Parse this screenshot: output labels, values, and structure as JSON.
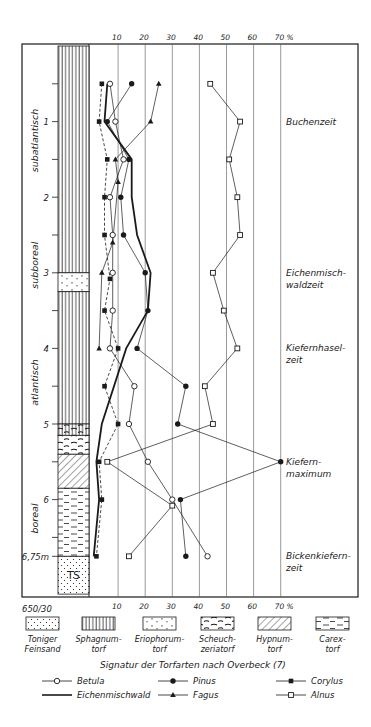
{
  "chart_data": {
    "type": "line",
    "xlabel": "%",
    "ylabel": "Depth (m)",
    "x_ticks": [
      "10",
      "20",
      "30",
      "40",
      "50",
      "60",
      "70 %"
    ],
    "x_tick_values": [
      10,
      20,
      30,
      40,
      50,
      60,
      70
    ],
    "xlim": [
      0,
      70
    ],
    "depth_ticks": [
      0.5,
      1,
      1.5,
      2,
      2.5,
      3,
      3.5,
      4,
      4.5,
      5,
      5.5,
      6,
      6.5,
      6.75
    ],
    "depth_labels": [
      {
        "depth": 1,
        "label": "1"
      },
      {
        "depth": 2,
        "label": "2"
      },
      {
        "depth": 3,
        "label": "3"
      },
      {
        "depth": 4,
        "label": "4"
      },
      {
        "depth": 5,
        "label": "5"
      },
      {
        "depth": 6,
        "label": "6"
      },
      {
        "depth": 6.75,
        "label": "6,75m"
      }
    ],
    "corner_label": "650/30",
    "periods": [
      {
        "label": "subatlantisch",
        "from": 0.3,
        "to": 2.2
      },
      {
        "label": "subboreal",
        "from": 2.2,
        "to": 3.6
      },
      {
        "label": "atlantisch",
        "from": 3.8,
        "to": 5.1
      },
      {
        "label": "boreal",
        "from": 5.7,
        "to": 6.8
      }
    ],
    "zones": [
      {
        "label": "Buchenzeit",
        "depth": 1.0
      },
      {
        "label": "Eichenmisch-",
        "label2": "waldzeit",
        "depth": 3.0
      },
      {
        "label": "Kiefernhasel-",
        "label2": "zeit",
        "depth": 4.0
      },
      {
        "label": "Kiefern-",
        "label2": "maximum",
        "depth": 5.5
      },
      {
        "label": "Bickenkiefern-",
        "label2": "zeit",
        "depth": 6.75
      }
    ],
    "series": [
      {
        "name": "Betula",
        "marker": "open-circle",
        "line": "thin",
        "points": [
          [
            0.5,
            7
          ],
          [
            1,
            9
          ],
          [
            1.5,
            12
          ],
          [
            2,
            7
          ],
          [
            2.5,
            8
          ],
          [
            3,
            8
          ],
          [
            3.5,
            8
          ],
          [
            4,
            7
          ],
          [
            4.5,
            16
          ],
          [
            5,
            14
          ],
          [
            5.5,
            21
          ],
          [
            6,
            30
          ],
          [
            6.75,
            43
          ]
        ]
      },
      {
        "name": "Pinus",
        "marker": "filled-circle",
        "line": "thin",
        "points": [
          [
            0.5,
            15
          ],
          [
            1,
            6
          ],
          [
            1.5,
            14
          ],
          [
            2,
            11
          ],
          [
            2.5,
            12
          ],
          [
            3,
            20
          ],
          [
            3.5,
            21
          ],
          [
            4,
            17
          ],
          [
            4.5,
            35
          ],
          [
            5,
            32
          ],
          [
            5.5,
            70
          ],
          [
            6,
            33
          ],
          [
            6.75,
            35
          ]
        ]
      },
      {
        "name": "Corylus",
        "marker": "filled-square",
        "line": "dashed",
        "points": [
          [
            0.5,
            4
          ],
          [
            1,
            3
          ],
          [
            1.5,
            6
          ],
          [
            2,
            5
          ],
          [
            2.5,
            5
          ],
          [
            3.08,
            7
          ],
          [
            3.5,
            5
          ],
          [
            4,
            10
          ],
          [
            4.5,
            5
          ],
          [
            5,
            10
          ],
          [
            5.5,
            3
          ],
          [
            6,
            4
          ],
          [
            6.75,
            2
          ]
        ]
      },
      {
        "name": "Eichenmischwald",
        "marker": "none",
        "line": "thick",
        "points": [
          [
            0.5,
            6
          ],
          [
            1,
            5
          ],
          [
            1.5,
            15
          ],
          [
            2,
            15
          ],
          [
            2.5,
            17
          ],
          [
            3,
            22
          ],
          [
            3.5,
            21
          ],
          [
            4,
            13
          ],
          [
            5,
            4
          ],
          [
            5.5,
            2
          ],
          [
            6,
            3
          ],
          [
            6.75,
            1
          ]
        ]
      },
      {
        "name": "Fagus",
        "marker": "filled-triangle",
        "line": "thin",
        "points": [
          [
            0.5,
            25
          ],
          [
            1,
            22
          ],
          [
            1.5,
            9
          ],
          [
            1.8,
            10
          ],
          [
            2.6,
            8
          ],
          [
            3,
            4
          ],
          [
            4,
            3
          ]
        ]
      },
      {
        "name": "Alnus",
        "marker": "open-square",
        "line": "thin",
        "points": [
          [
            0.5,
            44
          ],
          [
            1,
            55
          ],
          [
            1.5,
            51
          ],
          [
            2,
            54
          ],
          [
            2.5,
            55
          ],
          [
            3,
            45
          ],
          [
            3.5,
            49
          ],
          [
            4,
            54
          ],
          [
            4.5,
            42
          ],
          [
            5,
            45
          ],
          [
            5.5,
            6
          ],
          [
            6.08,
            30
          ],
          [
            6.75,
            14
          ]
        ]
      }
    ],
    "sediment_column": [
      {
        "type": "sphagnum",
        "from": 0.0,
        "to": 3.0
      },
      {
        "type": "eriophorum",
        "from": 3.0,
        "to": 3.25
      },
      {
        "type": "sphagnum",
        "from": 3.25,
        "to": 5.0
      },
      {
        "type": "sphagnum-scheuchzeria",
        "from": 5.0,
        "to": 5.15
      },
      {
        "type": "scheuchzeria",
        "from": 5.15,
        "to": 5.4
      },
      {
        "type": "hypnum",
        "from": 5.4,
        "to": 5.85
      },
      {
        "type": "carex",
        "from": 5.85,
        "to": 6.75
      },
      {
        "type": "sand",
        "from": 6.75,
        "to": 7.25,
        "label": "TS"
      }
    ]
  },
  "sediment_legend": {
    "title": "Signatur der Torfarten nach Overbeck (7)",
    "items": [
      {
        "type": "sand",
        "line1": "Toniger",
        "line2": "Feinsand"
      },
      {
        "type": "sphagnum",
        "line1": "Sphagnum-",
        "line2": "torf"
      },
      {
        "type": "eriophorum",
        "line1": "Eriophorum-",
        "line2": "torf"
      },
      {
        "type": "scheuchzeria",
        "line1": "Scheuch-",
        "line2": "zeriatorf"
      },
      {
        "type": "hypnum",
        "line1": "Hypnum-",
        "line2": "torf"
      },
      {
        "type": "carex",
        "line1": "Carex-",
        "line2": "torf"
      }
    ]
  },
  "series_legend": [
    {
      "name": "Betula",
      "marker": "open-circle",
      "line": "thin"
    },
    {
      "name": "Pinus",
      "marker": "filled-circle",
      "line": "thin"
    },
    {
      "name": "Corylus",
      "marker": "filled-square",
      "line": "thin"
    },
    {
      "name": "Eichenmischwald",
      "marker": "none",
      "line": "thick"
    },
    {
      "name": "Fagus",
      "marker": "filled-triangle",
      "line": "thin"
    },
    {
      "name": "Alnus",
      "marker": "open-square",
      "line": "thin"
    }
  ],
  "colors": {
    "ink": "#1a1a1a",
    "paper": "#ffffff",
    "grid": "#555555"
  }
}
